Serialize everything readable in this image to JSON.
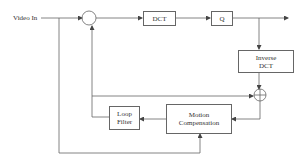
{
  "diagram": {
    "input_label": "Video In",
    "blocks": {
      "dct": "DCT",
      "quantizer": "Q",
      "inverse_dct_line1": "Inverse",
      "inverse_dct_line2": "DCT",
      "motion_comp_line1": "Motion",
      "motion_comp_line2": "Compensation",
      "loop_filter_line1": "Loop",
      "loop_filter_line2": "Filter"
    },
    "nodes": [
      "subtractor",
      "adder"
    ],
    "line_color": "#555555"
  }
}
